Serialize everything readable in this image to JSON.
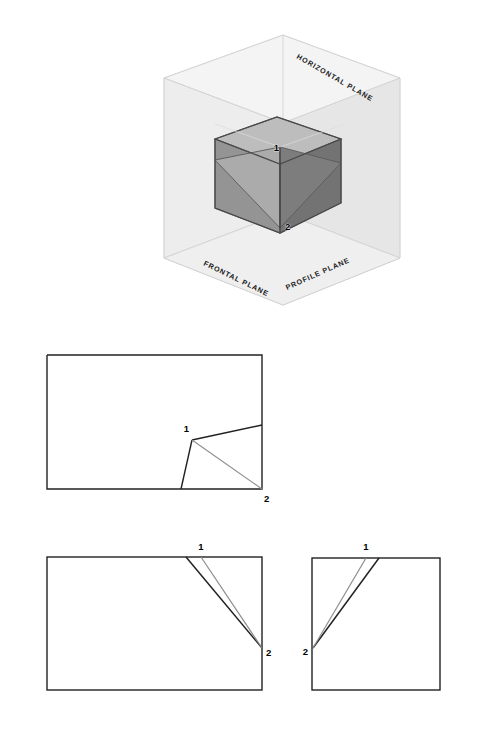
{
  "figure": {
    "background_color": "#ffffff",
    "width": 485,
    "height": 729
  },
  "isometric": {
    "name": "glass-box-pictorial",
    "plane_labels": [
      {
        "id": "horizontal",
        "text": "HORIZONTAL PLANE",
        "x": 296,
        "y": 58,
        "rotate": 30
      },
      {
        "id": "frontal",
        "text": "FRONTAL PLANE",
        "x": 203,
        "y": 265,
        "rotate": 26
      },
      {
        "id": "profile",
        "text": "PROFILE PLANE",
        "x": 287,
        "y": 290,
        "rotate": -24
      }
    ],
    "point_labels": [
      {
        "id": "1",
        "text": "1",
        "x": 279,
        "y": 151
      },
      {
        "id": "2",
        "text": "2",
        "x": 285,
        "y": 230
      }
    ],
    "colors": {
      "box_line": "#d4d4d4",
      "plane_fill_top": "#f1f1f1",
      "plane_fill_left": "#eaeaea",
      "plane_fill_right": "#e3e3e3",
      "solid_top": "#b8b8b8",
      "solid_front_left": "#8f8f8f",
      "solid_right": "#6f6f6f",
      "solid_notch_light": "#a8a8a8",
      "solid_notch_dark": "#7b7b7b",
      "solid_outline": "#555555"
    }
  },
  "views": {
    "top_view": {
      "name": "top-view",
      "description": "Top (horizontal) projection: rectangle with inclined notch at lower right",
      "rect": {
        "x": 47,
        "y": 355,
        "width": 215,
        "height": 134
      },
      "point_labels": [
        {
          "id": "1",
          "text": "1",
          "x": 189,
          "y": 432
        },
        {
          "id": "2",
          "text": "2",
          "x": 264,
          "y": 499
        }
      ]
    },
    "front_view": {
      "name": "front-view",
      "description": "Front (frontal) projection: rectangle with two converging lines to point 2",
      "rect": {
        "x": 47,
        "y": 557,
        "width": 215,
        "height": 133
      },
      "point_labels": [
        {
          "id": "1",
          "text": "1",
          "x": 200,
          "y": 550
        },
        {
          "id": "2",
          "text": "2",
          "x": 265,
          "y": 653
        }
      ]
    },
    "side_view": {
      "name": "side-view",
      "description": "Right side (profile) projection: square with two converging lines to point 2",
      "rect": {
        "x": 312,
        "y": 558,
        "width": 128,
        "height": 132
      },
      "point_labels": [
        {
          "id": "1",
          "text": "1",
          "x": 366,
          "y": 550
        },
        {
          "id": "2",
          "text": "2",
          "x": 298,
          "y": 655
        }
      ]
    },
    "line_colors": {
      "object_line": "#222222",
      "secondary_line": "#8c8c8c"
    }
  }
}
